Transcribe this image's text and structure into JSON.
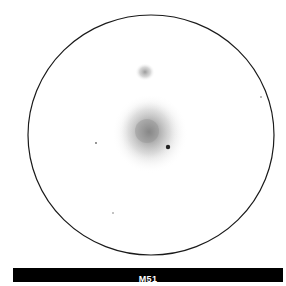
{
  "sketch": {
    "object_label": "M51",
    "field_of_view": {
      "shape": "circle",
      "center": [
        151,
        135
      ],
      "rx": 123,
      "ry": 120,
      "stroke_color": "#1a1a1a"
    },
    "galaxies": [
      {
        "name": "companion-galaxy",
        "center": [
          145,
          72
        ],
        "rx": 9,
        "ry": 8,
        "core_color": "#8a8a8a"
      },
      {
        "name": "main-galaxy",
        "center": [
          149,
          133
        ],
        "rx": 34,
        "ry": 37,
        "core_color": "#7a7a7a"
      }
    ],
    "stars": [
      {
        "name": "bright-star",
        "x": 168,
        "y": 147,
        "r": 2.2,
        "color": "#222222"
      },
      {
        "name": "star-left",
        "x": 96,
        "y": 143,
        "r": 0.9,
        "color": "#666666"
      },
      {
        "name": "star-right",
        "x": 261,
        "y": 97,
        "r": 0.8,
        "color": "#666666"
      },
      {
        "name": "star-bottom",
        "x": 113,
        "y": 213,
        "r": 0.8,
        "color": "#777777"
      }
    ]
  },
  "caption": {
    "background": "#000000",
    "text_color": "#ffffff"
  }
}
